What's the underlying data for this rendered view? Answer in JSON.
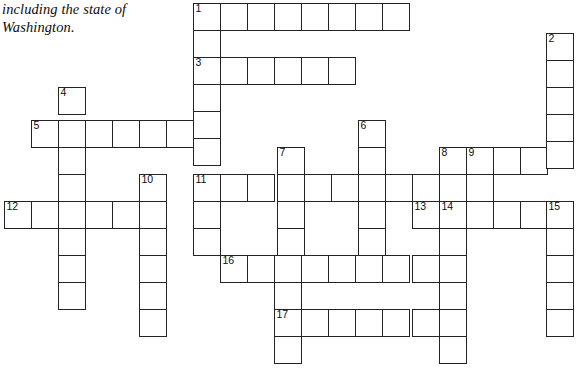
{
  "page": {
    "background_color": "#ffffff",
    "ink_color": "#262423",
    "width": 581,
    "height": 374
  },
  "prose": {
    "lines": [
      "including the state of",
      "Washington."
    ]
  },
  "grid": {
    "origin": {
      "x": 193,
      "y": 3
    },
    "cell_size": 27,
    "border_color": "#262423",
    "cell_fill": "#ffffff",
    "numbers": [
      1,
      2,
      3,
      4,
      5,
      6,
      7,
      8,
      9,
      10,
      11,
      12,
      13,
      14,
      15,
      16,
      17
    ],
    "entries": [
      {
        "number": 1,
        "direction": "across",
        "row": 0,
        "col": 0,
        "length": 8
      },
      {
        "number": 1,
        "direction": "down",
        "row": 0,
        "col": 0,
        "length": 10
      },
      {
        "number": 2,
        "direction": "down",
        "row": 1,
        "col": 13,
        "length": 5
      },
      {
        "number": 3,
        "direction": "across",
        "row": 2,
        "col": 0,
        "length": 6
      },
      {
        "number": 4,
        "direction": "down",
        "row": 3,
        "col": -5,
        "length": 9
      },
      {
        "number": 5,
        "direction": "across",
        "row": 4,
        "col": -6,
        "length": 6
      },
      {
        "number": 6,
        "direction": "down",
        "row": 4,
        "col": 6,
        "length": 5
      },
      {
        "number": 7,
        "direction": "down",
        "row": 5,
        "col": 3,
        "length": 5
      },
      {
        "number": 8,
        "direction": "across",
        "row": 5,
        "col": 9,
        "length": 5
      },
      {
        "number": 9,
        "direction": "down",
        "row": 5,
        "col": 10,
        "length": 6
      },
      {
        "number": 10,
        "direction": "down",
        "row": 6,
        "col": -2,
        "length": 7
      },
      {
        "number": 11,
        "direction": "across",
        "row": 6,
        "col": 0,
        "length": 9
      },
      {
        "number": 11,
        "direction": "down",
        "row": 6,
        "col": 0,
        "length": 4
      },
      {
        "number": 12,
        "direction": "across",
        "row": 7,
        "col": -7,
        "length": 5
      },
      {
        "number": 13,
        "direction": "across",
        "row": 7,
        "col": 8,
        "length": 6
      },
      {
        "number": 14,
        "direction": "down",
        "row": 7,
        "col": 9,
        "length": 6
      },
      {
        "number": 15,
        "direction": "down",
        "row": 7,
        "col": 13,
        "length": 6
      },
      {
        "number": 16,
        "direction": "across",
        "row": 9,
        "col": 1,
        "length": 8
      },
      {
        "number": 17,
        "direction": "across",
        "row": 11,
        "col": 3,
        "length": 6
      }
    ],
    "cells": [
      {
        "x": 193,
        "y": 3,
        "num": "1"
      },
      {
        "x": 220,
        "y": 3,
        "num": ""
      },
      {
        "x": 247,
        "y": 3,
        "num": ""
      },
      {
        "x": 274,
        "y": 3,
        "num": ""
      },
      {
        "x": 301,
        "y": 3,
        "num": ""
      },
      {
        "x": 328,
        "y": 3,
        "num": ""
      },
      {
        "x": 355,
        "y": 3,
        "num": ""
      },
      {
        "x": 382,
        "y": 3,
        "num": ""
      },
      {
        "x": 193,
        "y": 30,
        "num": ""
      },
      {
        "x": 546,
        "y": 33,
        "num": "2"
      },
      {
        "x": 193,
        "y": 57,
        "num": "3"
      },
      {
        "x": 220,
        "y": 57,
        "num": ""
      },
      {
        "x": 247,
        "y": 57,
        "num": ""
      },
      {
        "x": 274,
        "y": 57,
        "num": ""
      },
      {
        "x": 301,
        "y": 57,
        "num": ""
      },
      {
        "x": 328,
        "y": 57,
        "num": ""
      },
      {
        "x": 546,
        "y": 60,
        "num": ""
      },
      {
        "x": 58,
        "y": 87,
        "num": "4"
      },
      {
        "x": 193,
        "y": 84,
        "num": ""
      },
      {
        "x": 546,
        "y": 87,
        "num": ""
      },
      {
        "x": 31,
        "y": 120,
        "num": "5"
      },
      {
        "x": 58,
        "y": 120,
        "num": ""
      },
      {
        "x": 85,
        "y": 120,
        "num": ""
      },
      {
        "x": 112,
        "y": 120,
        "num": ""
      },
      {
        "x": 139,
        "y": 120,
        "num": ""
      },
      {
        "x": 166,
        "y": 120,
        "num": ""
      },
      {
        "x": 193,
        "y": 111,
        "num": ""
      },
      {
        "x": 358,
        "y": 120,
        "num": "6"
      },
      {
        "x": 439,
        "y": 147,
        "num": "8"
      },
      {
        "x": 546,
        "y": 114,
        "num": ""
      },
      {
        "x": 58,
        "y": 147,
        "num": ""
      },
      {
        "x": 193,
        "y": 138,
        "num": ""
      },
      {
        "x": 277,
        "y": 147,
        "num": "7"
      },
      {
        "x": 358,
        "y": 147,
        "num": ""
      },
      {
        "x": 466,
        "y": 147,
        "num": "9"
      },
      {
        "x": 493,
        "y": 147,
        "num": ""
      },
      {
        "x": 520,
        "y": 147,
        "num": ""
      },
      {
        "x": 546,
        "y": 141,
        "num": ""
      },
      {
        "x": 58,
        "y": 174,
        "num": ""
      },
      {
        "x": 139,
        "y": 174,
        "num": "10"
      },
      {
        "x": 193,
        "y": 174,
        "num": "11"
      },
      {
        "x": 220,
        "y": 174,
        "num": ""
      },
      {
        "x": 247,
        "y": 174,
        "num": ""
      },
      {
        "x": 277,
        "y": 174,
        "num": ""
      },
      {
        "x": 304,
        "y": 174,
        "num": ""
      },
      {
        "x": 331,
        "y": 174,
        "num": ""
      },
      {
        "x": 358,
        "y": 174,
        "num": ""
      },
      {
        "x": 385,
        "y": 174,
        "num": ""
      },
      {
        "x": 412,
        "y": 174,
        "num": ""
      },
      {
        "x": 466,
        "y": 174,
        "num": ""
      },
      {
        "x": 4,
        "y": 201,
        "num": "12"
      },
      {
        "x": 31,
        "y": 201,
        "num": ""
      },
      {
        "x": 58,
        "y": 201,
        "num": ""
      },
      {
        "x": 85,
        "y": 201,
        "num": ""
      },
      {
        "x": 112,
        "y": 201,
        "num": ""
      },
      {
        "x": 139,
        "y": 201,
        "num": ""
      },
      {
        "x": 193,
        "y": 201,
        "num": ""
      },
      {
        "x": 277,
        "y": 201,
        "num": ""
      },
      {
        "x": 358,
        "y": 201,
        "num": ""
      },
      {
        "x": 412,
        "y": 201,
        "num": "13"
      },
      {
        "x": 439,
        "y": 201,
        "num": "14"
      },
      {
        "x": 466,
        "y": 201,
        "num": ""
      },
      {
        "x": 493,
        "y": 201,
        "num": ""
      },
      {
        "x": 520,
        "y": 201,
        "num": ""
      },
      {
        "x": 546,
        "y": 201,
        "num": "15"
      },
      {
        "x": 58,
        "y": 228,
        "num": ""
      },
      {
        "x": 139,
        "y": 228,
        "num": ""
      },
      {
        "x": 193,
        "y": 228,
        "num": ""
      },
      {
        "x": 277,
        "y": 228,
        "num": ""
      },
      {
        "x": 358,
        "y": 228,
        "num": ""
      },
      {
        "x": 439,
        "y": 228,
        "num": ""
      },
      {
        "x": 546,
        "y": 228,
        "num": ""
      },
      {
        "x": 58,
        "y": 255,
        "num": ""
      },
      {
        "x": 139,
        "y": 255,
        "num": ""
      },
      {
        "x": 220,
        "y": 255,
        "num": "16"
      },
      {
        "x": 247,
        "y": 255,
        "num": ""
      },
      {
        "x": 274,
        "y": 255,
        "num": ""
      },
      {
        "x": 301,
        "y": 255,
        "num": ""
      },
      {
        "x": 328,
        "y": 255,
        "num": ""
      },
      {
        "x": 355,
        "y": 255,
        "num": ""
      },
      {
        "x": 382,
        "y": 255,
        "num": ""
      },
      {
        "x": 412,
        "y": 255,
        "num": ""
      },
      {
        "x": 439,
        "y": 255,
        "num": ""
      },
      {
        "x": 546,
        "y": 255,
        "num": ""
      },
      {
        "x": 58,
        "y": 282,
        "num": ""
      },
      {
        "x": 139,
        "y": 282,
        "num": ""
      },
      {
        "x": 274,
        "y": 282,
        "num": ""
      },
      {
        "x": 439,
        "y": 282,
        "num": ""
      },
      {
        "x": 546,
        "y": 282,
        "num": ""
      },
      {
        "x": 139,
        "y": 309,
        "num": ""
      },
      {
        "x": 274,
        "y": 309,
        "num": "17"
      },
      {
        "x": 301,
        "y": 309,
        "num": ""
      },
      {
        "x": 328,
        "y": 309,
        "num": ""
      },
      {
        "x": 355,
        "y": 309,
        "num": ""
      },
      {
        "x": 382,
        "y": 309,
        "num": ""
      },
      {
        "x": 412,
        "y": 309,
        "num": ""
      },
      {
        "x": 439,
        "y": 309,
        "num": ""
      },
      {
        "x": 546,
        "y": 309,
        "num": ""
      },
      {
        "x": 274,
        "y": 336,
        "num": ""
      },
      {
        "x": 439,
        "y": 336,
        "num": ""
      }
    ]
  }
}
